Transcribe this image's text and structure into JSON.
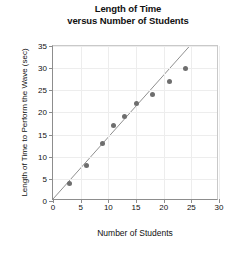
{
  "chart_data": {
    "type": "scatter",
    "title": "Length of Time versus Number of Students",
    "title_lines": [
      "Length of Time",
      "versus Number of Students"
    ],
    "xlabel": "Number of Students",
    "ylabel": "Length of Time to Perform the Wave (sec)",
    "xlim": [
      0,
      30
    ],
    "ylim": [
      0,
      35
    ],
    "xticks": [
      0,
      5,
      10,
      15,
      20,
      25,
      30
    ],
    "yticks": [
      0,
      5,
      10,
      15,
      20,
      25,
      30,
      35
    ],
    "grid": true,
    "legend": "none",
    "marker_color": "#6e6e6e",
    "line_color": "#8d8d8d",
    "axis_color": "#8d8d8d",
    "points": [
      {
        "x": 3,
        "y": 4
      },
      {
        "x": 6,
        "y": 8
      },
      {
        "x": 9,
        "y": 13
      },
      {
        "x": 11,
        "y": 17
      },
      {
        "x": 13,
        "y": 19
      },
      {
        "x": 15,
        "y": 22
      },
      {
        "x": 18,
        "y": 24
      },
      {
        "x": 21,
        "y": 27
      },
      {
        "x": 24,
        "y": 30
      }
    ],
    "trend_line": {
      "label": "line of best fit",
      "x_start": 0,
      "y_start": 0,
      "x_end": 25,
      "y_end": 35
    }
  }
}
